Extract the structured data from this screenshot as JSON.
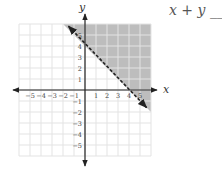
{
  "equation": {
    "lhs": "x + y",
    "blank": "__",
    "rhs": "4"
  },
  "chart_data": {
    "type": "inequality-graph",
    "title": "x + y __ 4",
    "xlabel": "x",
    "ylabel": "y",
    "xlim": [
      -6,
      6
    ],
    "ylim": [
      -6,
      6
    ],
    "x_ticks": [
      -5,
      -4,
      -3,
      -2,
      -1,
      1,
      2,
      3,
      4,
      5
    ],
    "y_ticks": [
      -5,
      -4,
      -3,
      -2,
      -1,
      1,
      2,
      3,
      4,
      5
    ],
    "grid": true,
    "boundary_line": {
      "equation": "x + y = 4",
      "style": "dashed",
      "points": [
        [
          -1.5,
          5.8
        ],
        [
          5.6,
          -1.6
        ]
      ]
    },
    "shaded_region": "above line (x + y > 4)",
    "colors": {
      "shade": "#bdbdbd",
      "grid": "#e3e3e3",
      "axis": "#222222",
      "line": "#222222"
    }
  },
  "labels": {
    "x": "x",
    "y": "y"
  }
}
